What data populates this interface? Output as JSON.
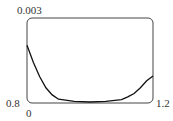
{
  "chart_data": {
    "type": "line",
    "title": "",
    "xlabel": "",
    "ylabel": "",
    "xlim": [
      0.8,
      1.2
    ],
    "ylim": [
      0,
      0.003
    ],
    "x_tick_labels": [
      "0.8",
      "1.2"
    ],
    "y_tick_labels": [
      "0",
      "0.003"
    ],
    "grid": false,
    "series": [
      {
        "name": "curve",
        "x": [
          0.8,
          0.82,
          0.84,
          0.86,
          0.88,
          0.9,
          0.95,
          1.0,
          1.05,
          1.1,
          1.12,
          1.14,
          1.16,
          1.18,
          1.2
        ],
        "y": [
          0.002,
          0.0014,
          0.0009,
          0.0005,
          0.00025,
          0.0001,
          2e-05,
          0.0,
          2e-05,
          8e-05,
          0.00018,
          0.0003,
          0.0005,
          0.00075,
          0.00092
        ]
      }
    ]
  },
  "labels": {
    "y_max": "0.003",
    "y_min": "0",
    "x_min": "0.8",
    "x_max": "1.2"
  }
}
